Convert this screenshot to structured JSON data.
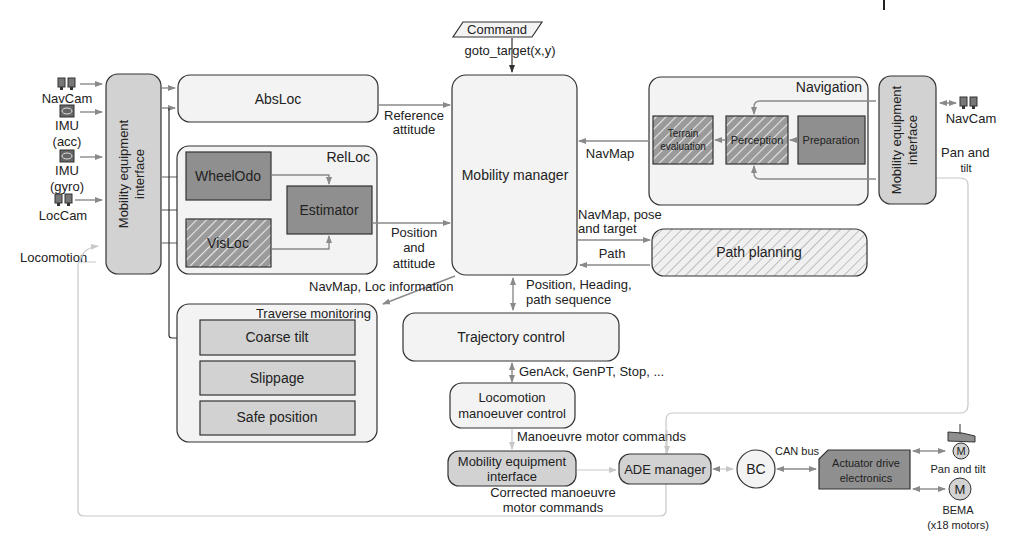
{
  "sensors_left": [
    {
      "label": "NavCam",
      "icon": "camera-pair-icon"
    },
    {
      "label": "IMU",
      "sub": "(acc)",
      "icon": "imu-icon"
    },
    {
      "label": "IMU",
      "sub": "(gyro)",
      "icon": "imu-icon"
    },
    {
      "label": "LocCam",
      "icon": "camera-pair-icon"
    },
    {
      "label": "Locomotion"
    }
  ],
  "blocks": {
    "mei_left": "Mobility equipment",
    "mei_left_2": "interface",
    "absloc": "AbsLoc",
    "relloc": "RelLoc",
    "wheelodo": "WheelOdo",
    "estimator": "Estimator",
    "visloc": "VisLoc",
    "mobility_manager": "Mobility manager",
    "command": "Command",
    "navigation": "Navigation",
    "terrain_1": "Terrain",
    "terrain_2": "evaluation",
    "perception": "Perception",
    "preparation": "Preparation",
    "mei_right": "Mobility equipment",
    "mei_right_2": "interface",
    "path_planning": "Path planning",
    "traverse_monitoring": "Traverse monitoring",
    "coarse_tilt": "Coarse tilt",
    "slippage": "Slippage",
    "safe_position": "Safe position",
    "trajectory_control": "Trajectory control",
    "loco_1": "Locomotion",
    "loco_2": "manoeuver control",
    "mei_bottom_1": "Mobility equipment",
    "mei_bottom_2": "interface",
    "ade_manager": "ADE manager",
    "bc": "BC",
    "ade_1": "Actuator drive",
    "ade_2": "electronics",
    "motor": "M"
  },
  "edge_labels": {
    "goto": "goto_target(x,y)",
    "ref_1": "Reference",
    "ref_2": "attitude",
    "pos_1": "Position",
    "pos_2": "and",
    "pos_3": "attitude",
    "navmap": "NavMap",
    "navmap_pose_1": "NavMap, pose",
    "navmap_pose_2": "and target",
    "path": "Path",
    "navmap_loc": "NavMap, Loc information",
    "pos_heading_1": "Position, Heading,",
    "pos_heading_2": "path sequence",
    "genack": "GenAck, GenPT, Stop, ...",
    "manoeuvre": "Manoeuvre motor commands",
    "corrected_1": "Corrected manoeuvre",
    "corrected_2": "motor commands",
    "can_bus": "CAN bus",
    "navcam_right": "NavCam",
    "pan_tilt_1": "Pan and",
    "pan_tilt_2": "tilt",
    "pan_tilt_motor": "Pan and tilt",
    "bema_1": "BEMA",
    "bema_2": "(x18 motors)"
  },
  "colors": {
    "light_fill": "#f3f3f3",
    "mid_fill": "#d2d2d2",
    "dark_fill": "#8f8f8f",
    "line": "#8a8a8a",
    "outline": "#333333"
  }
}
